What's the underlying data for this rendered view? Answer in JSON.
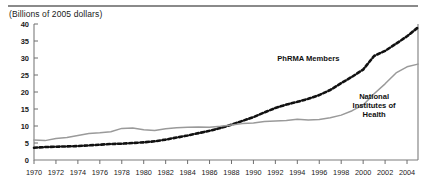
{
  "chart_data": {
    "type": "line",
    "title": "",
    "subtitle": "",
    "unit_label": "(Billions of 2005 dollars)",
    "xlabel": "",
    "ylabel": "",
    "xlim": [
      1970,
      2005
    ],
    "ylim": [
      0,
      40
    ],
    "ytick_step": 5,
    "xtick_step": 2,
    "grid": false,
    "legend_position": "inline-annotations",
    "yticks": [
      "0",
      "5",
      "10",
      "15",
      "20",
      "25",
      "30",
      "35",
      "40"
    ],
    "xticks": [
      "1970",
      "1972",
      "1974",
      "1976",
      "1978",
      "1980",
      "1982",
      "1984",
      "1986",
      "1988",
      "1990",
      "1992",
      "1994",
      "1996",
      "1998",
      "2000",
      "2002",
      "2004"
    ],
    "x": [
      1970,
      1971,
      1972,
      1973,
      1974,
      1975,
      1976,
      1977,
      1978,
      1979,
      1980,
      1981,
      1982,
      1983,
      1984,
      1985,
      1986,
      1987,
      1988,
      1989,
      1990,
      1991,
      1992,
      1993,
      1994,
      1995,
      1996,
      1997,
      1998,
      1999,
      2000,
      2001,
      2002,
      2003,
      2004,
      2005
    ],
    "series": [
      {
        "name": "PhRMA Members",
        "style": "dashed",
        "color": "#111111",
        "label_x": 1995,
        "label_y": 29,
        "values": [
          3.6,
          3.8,
          3.9,
          4.0,
          4.1,
          4.3,
          4.5,
          4.7,
          4.8,
          5.0,
          5.2,
          5.5,
          6.0,
          6.6,
          7.2,
          7.9,
          8.6,
          9.4,
          10.4,
          11.5,
          12.6,
          14.0,
          15.3,
          16.3,
          17.1,
          18.0,
          19.1,
          20.6,
          22.6,
          24.5,
          26.6,
          30.6,
          32.1,
          34.2,
          36.4,
          39.0
        ]
      },
      {
        "name": "National Institutes of Health",
        "style": "solid",
        "color": "#9a9a9a",
        "label_x": 2001,
        "label_y": 18,
        "values": [
          5.9,
          5.7,
          6.3,
          6.6,
          7.2,
          7.8,
          8.0,
          8.3,
          9.3,
          9.4,
          8.9,
          8.7,
          9.2,
          9.5,
          9.6,
          9.7,
          9.6,
          9.9,
          10.3,
          10.7,
          10.9,
          11.3,
          11.5,
          11.6,
          12.0,
          11.8,
          11.9,
          12.4,
          13.2,
          14.5,
          16.2,
          19.5,
          22.4,
          25.6,
          27.4,
          28.2
        ]
      }
    ]
  }
}
